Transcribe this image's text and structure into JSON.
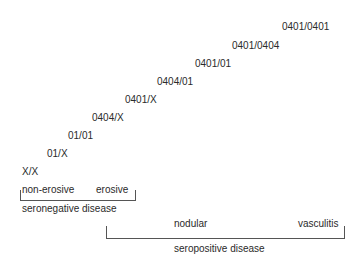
{
  "genotypes": [
    {
      "label": "0401/0401",
      "x": 282,
      "y": 21
    },
    {
      "label": "0401/0404",
      "x": 232,
      "y": 40
    },
    {
      "label": "0401/01",
      "x": 195,
      "y": 58
    },
    {
      "label": "0404/01",
      "x": 157,
      "y": 76
    },
    {
      "label": "0401/X",
      "x": 125,
      "y": 94
    },
    {
      "label": "0404/X",
      "x": 92,
      "y": 112
    },
    {
      "label": "01/01",
      "x": 68,
      "y": 130
    },
    {
      "label": "01/X",
      "x": 47,
      "y": 148
    },
    {
      "label": "X/X",
      "x": 22,
      "y": 166
    }
  ],
  "seronegative": {
    "sublabels": [
      "non-erosive",
      "erosive"
    ],
    "title": "seronegative disease"
  },
  "seropositive": {
    "sublabels": [
      "nodular",
      "vasculitis"
    ],
    "title": "seropositive disease"
  }
}
